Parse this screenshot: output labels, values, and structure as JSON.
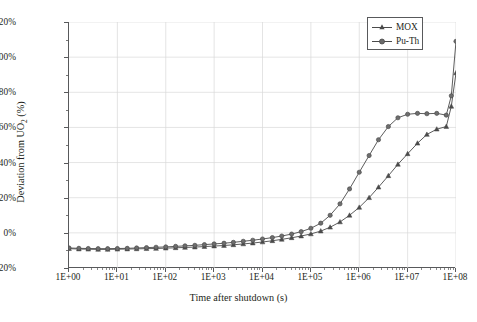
{
  "chart_data": {
    "type": "line",
    "title": "",
    "xlabel": "Time after shutdown (s)",
    "ylabel_html": "Deviation from UO<sub>2</sub> (%)",
    "ylabel_text": "Deviation from UO2 (%)",
    "xscale": "log",
    "yscale": "linear",
    "xlim": [
      1,
      100000000
    ],
    "ylim": [
      -20,
      120
    ],
    "xtick_labels": [
      "1E+00",
      "1E+01",
      "1E+02",
      "1E+03",
      "1E+04",
      "1E+05",
      "1E+06",
      "1E+07",
      "1E+08"
    ],
    "xtick_values": [
      1,
      10,
      100,
      1000,
      10000,
      100000,
      1000000,
      10000000,
      100000000
    ],
    "ytick_labels": [
      "-20%",
      "0%",
      "20%",
      "40%",
      "60%",
      "80%",
      "100%",
      "120%"
    ],
    "ytick_values": [
      -20,
      0,
      20,
      40,
      60,
      80,
      100,
      120
    ],
    "grid": true,
    "grid_color": "#d9d9d9",
    "line_color": "#4a4a4a",
    "legend_position": "top-right",
    "series": [
      {
        "name": "MOX",
        "marker": "triangle",
        "color": "#4a4a4a",
        "x": [
          1,
          1.6,
          2.5,
          4,
          6.3,
          10,
          16,
          25,
          40,
          63,
          100,
          160,
          250,
          400,
          630,
          1000,
          1600,
          2500,
          4000,
          6300,
          10000,
          16000,
          25000,
          40000,
          63000,
          100000,
          160000,
          250000,
          400000,
          630000,
          1000000,
          1600000,
          2500000,
          4000000,
          6300000,
          10000000,
          16000000,
          25000000,
          40000000,
          63000000,
          80000000,
          100000000
        ],
        "y": [
          -9.0,
          -9.2,
          -9.3,
          -9.4,
          -9.4,
          -9.3,
          -9.2,
          -9.1,
          -9.0,
          -8.9,
          -8.7,
          -8.5,
          -8.3,
          -8.1,
          -7.8,
          -7.5,
          -7.2,
          -6.8,
          -6.3,
          -5.8,
          -5.2,
          -4.5,
          -3.7,
          -2.8,
          -1.8,
          -0.6,
          1.0,
          3.2,
          6.2,
          10.0,
          14.5,
          20.0,
          26.0,
          32.5,
          39.0,
          45.0,
          51.0,
          56.0,
          59.0,
          60.5,
          72.0,
          91.0
        ]
      },
      {
        "name": "Pu-Th",
        "marker": "circle",
        "color": "#4a4a4a",
        "x": [
          1,
          1.6,
          2.5,
          4,
          6.3,
          10,
          16,
          25,
          40,
          63,
          100,
          160,
          250,
          400,
          630,
          1000,
          1600,
          2500,
          4000,
          6300,
          10000,
          16000,
          25000,
          40000,
          63000,
          100000,
          160000,
          250000,
          400000,
          630000,
          1000000,
          1600000,
          2500000,
          4000000,
          6300000,
          10000000,
          16000000,
          25000000,
          40000000,
          63000000,
          80000000,
          100000000
        ],
        "y": [
          -8.6,
          -8.8,
          -8.9,
          -9.0,
          -9.0,
          -8.9,
          -8.8,
          -8.6,
          -8.4,
          -8.2,
          -8.0,
          -7.7,
          -7.4,
          -7.1,
          -6.7,
          -6.3,
          -5.9,
          -5.4,
          -4.8,
          -4.2,
          -3.5,
          -2.7,
          -1.8,
          -0.7,
          0.7,
          2.6,
          5.5,
          10.0,
          16.5,
          25.0,
          34.5,
          44.0,
          53.0,
          60.5,
          65.5,
          67.5,
          68.0,
          67.8,
          68.0,
          67.0,
          78.0,
          109.0
        ]
      }
    ]
  },
  "legend": {
    "items": [
      {
        "label": "MOX"
      },
      {
        "label": "Pu-Th"
      }
    ]
  }
}
